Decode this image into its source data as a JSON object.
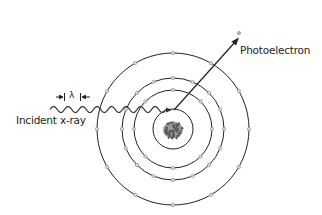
{
  "diagram": {
    "labels": {
      "photoelectron": "Photoelectron",
      "incident": "Incident x-ray",
      "wavelength_symbol": "λ"
    },
    "atom": {
      "center": [
        173,
        129
      ],
      "shells": [
        {
          "radius": 20,
          "electrons": 0
        },
        {
          "radius": 39,
          "electrons": 8
        },
        {
          "radius": 51,
          "electrons": 16
        },
        {
          "radius": 76,
          "electrons": 12
        }
      ]
    },
    "colors": {
      "line": "#222222",
      "electron_fill": "#d8d8d8",
      "electron_stroke": "#888888",
      "nucleus": "#555555"
    }
  }
}
